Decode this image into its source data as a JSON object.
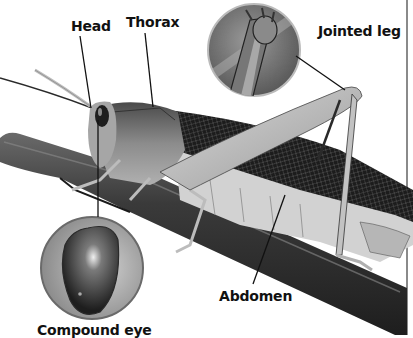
{
  "diagram": {
    "style": "grayscale photograph with callout labels",
    "colors": {
      "background": "#ffffff",
      "label_text": "#111111",
      "leader_line": "#111111",
      "frame_line": "#8a8a8a",
      "branch_dark": "#3a3a3a",
      "body_mid": "#7a7a7a",
      "body_light": "#c8c8c8",
      "wing_dark": "#222222"
    },
    "labels": [
      {
        "id": "head",
        "text": "Head"
      },
      {
        "id": "thorax",
        "text": "Thorax"
      },
      {
        "id": "jointed_leg",
        "text": "Jointed leg"
      },
      {
        "id": "abdomen",
        "text": "Abdomen"
      },
      {
        "id": "compound_eye",
        "text": "Compound eye"
      }
    ],
    "insets": [
      {
        "id": "jointed-leg-inset",
        "depicts": "close-up of leg joint"
      },
      {
        "id": "compound-eye-inset",
        "depicts": "close-up of compound eye"
      }
    ]
  }
}
